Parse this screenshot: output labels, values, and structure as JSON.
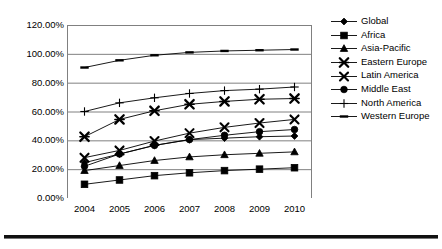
{
  "chart_data": {
    "type": "line",
    "title": "",
    "subtitle": "",
    "xlabel": "",
    "ylabel": "",
    "categories": [
      "2004",
      "2005",
      "2006",
      "2007",
      "2008",
      "2009",
      "2010"
    ],
    "x": [
      2004,
      2005,
      2006,
      2007,
      2008,
      2009,
      2010
    ],
    "ylim": [
      0,
      120
    ],
    "ytick_values": [
      0,
      20,
      40,
      60,
      80,
      100,
      120
    ],
    "ytick_labels": [
      "0.00%",
      "20.00%",
      "40.00%",
      "60.00%",
      "80.00%",
      "100.00%",
      "120.00%"
    ],
    "grid": true,
    "grid_axis": "y",
    "legend_position": "right",
    "value_suffix": "%",
    "series": [
      {
        "name": "Global",
        "marker": "diamond",
        "values": [
          24.5,
          30.5,
          36.5,
          40.5,
          41.5,
          42.5,
          43.0
        ]
      },
      {
        "name": "Africa",
        "marker": "square",
        "values": [
          9.5,
          12.5,
          15.5,
          17.5,
          19.0,
          20.0,
          21.0
        ]
      },
      {
        "name": "Asia-Pacific",
        "marker": "triangle",
        "values": [
          19.0,
          22.5,
          26.0,
          28.5,
          30.0,
          31.0,
          32.0
        ]
      },
      {
        "name": "Eastern Europe",
        "marker": "asterisk",
        "values": [
          42.5,
          54.5,
          60.5,
          65.0,
          67.0,
          68.5,
          69.0
        ]
      },
      {
        "name": "Latin America",
        "marker": "cross",
        "values": [
          28.0,
          33.0,
          39.5,
          45.0,
          49.0,
          52.0,
          54.5
        ]
      },
      {
        "name": "Middle East",
        "marker": "circle",
        "values": [
          22.0,
          30.5,
          36.5,
          40.5,
          43.5,
          46.0,
          47.5
        ]
      },
      {
        "name": "North America",
        "marker": "plus",
        "values": [
          60.0,
          66.0,
          69.5,
          72.5,
          74.5,
          75.5,
          77.0
        ]
      },
      {
        "name": "Western Europe",
        "marker": "dash",
        "values": [
          90.5,
          95.5,
          99.0,
          101.0,
          102.0,
          102.5,
          103.0
        ]
      }
    ]
  },
  "colors": {
    "line": "#000000",
    "grid": "#808080",
    "axis": "#808080",
    "text": "#000000",
    "background": "#ffffff",
    "rule": "#111111"
  }
}
